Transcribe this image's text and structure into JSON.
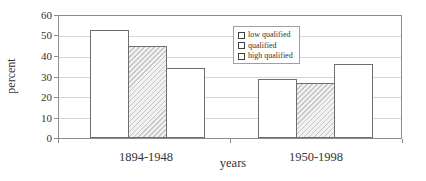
{
  "chart_data": {
    "type": "bar",
    "title": "",
    "xlabel": "years",
    "ylabel": "percent",
    "categories": [
      "1894-1948",
      "1950-1998"
    ],
    "series": [
      {
        "name": "low qualified",
        "fill": "white",
        "values": [
          53,
          29
        ]
      },
      {
        "name": "qualified",
        "fill": "hatch",
        "values": [
          45,
          27
        ]
      },
      {
        "name": "high qualified",
        "fill": "white",
        "values": [
          34.5,
          36.5
        ]
      }
    ],
    "ylim": [
      0,
      60
    ],
    "ytick_step": 10,
    "yticks": [
      0,
      10,
      20,
      30,
      40,
      50,
      60
    ],
    "grid": true,
    "legend_position": "inside-top-right"
  },
  "colors": {
    "bar_border": "#6e6e6e",
    "axis": "#8c8c8c",
    "gridline": "#d6d6d6",
    "hatch_line": "#c6c6c6",
    "background": "#ffffff",
    "text": "#303030"
  }
}
